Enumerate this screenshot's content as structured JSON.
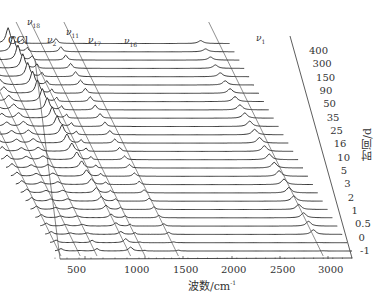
{
  "chart_data": {
    "type": "line",
    "title": "",
    "xlabel": "波数/cm⁻¹",
    "ylabel": "时间/d",
    "x_ticks": [
      500,
      1000,
      1500,
      2000,
      2500,
      3000
    ],
    "xlim": [
      300,
      3250
    ],
    "time_labels": [
      "400",
      "300",
      "150",
      "90",
      "50",
      "35",
      "25",
      "16",
      "10",
      "5",
      "3",
      "2",
      "1",
      "0.5",
      "0",
      "-1"
    ],
    "num_traces": 26,
    "peak_annotations": [
      {
        "label": "CCl",
        "sub": ""
      },
      {
        "label": "ν",
        "sub": "18"
      },
      {
        "label": "ν",
        "sub": "2"
      },
      {
        "label": "ν",
        "sub": "11"
      },
      {
        "label": "ν",
        "sub": "17"
      },
      {
        "label": "ν",
        "sub": "16"
      },
      {
        "label": "ν",
        "sub": "1"
      }
    ],
    "peaks_cm1": [
      {
        "name": "CCl",
        "position": 300
      },
      {
        "name": "ν18",
        "position": 460
      },
      {
        "name": "ν2",
        "position": 600
      },
      {
        "name": "ν11",
        "position": 880
      },
      {
        "name": "ν17",
        "position": 1000
      },
      {
        "name": "ν16",
        "position": 1440
      },
      {
        "name": "ν1",
        "position": 2950
      }
    ],
    "grid": false,
    "legend": "none",
    "style": "waterfall (stacked Raman spectra over time)"
  },
  "axis": {
    "xlabel_main": "波数/cm",
    "xlabel_sup": "-1",
    "ylabel": "时间/d"
  }
}
